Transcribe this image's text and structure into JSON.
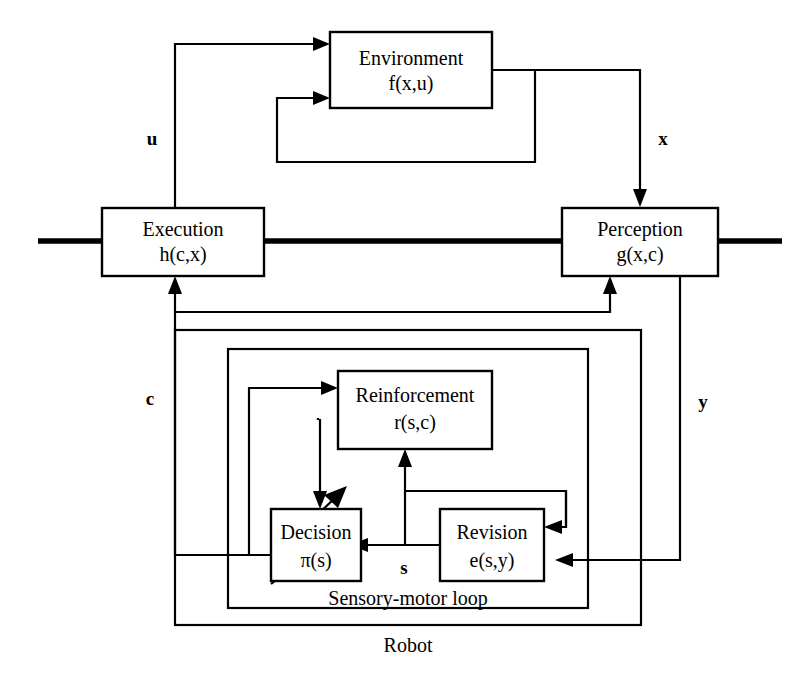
{
  "diagram": {
    "stroke_color": "#000000",
    "background_color": "#ffffff",
    "boxes": [
      {
        "id": "environment",
        "line1": "Environment",
        "line2": "f(x,u)"
      },
      {
        "id": "execution",
        "line1": "Execution",
        "line2": "h(c,x)"
      },
      {
        "id": "perception",
        "line1": "Perception",
        "line2": "g(x,c)"
      },
      {
        "id": "reinforcement",
        "line1": "Reinforcement",
        "line2": "r(s,c)"
      },
      {
        "id": "decision",
        "line1": "Decision",
        "line2": "π(s)"
      },
      {
        "id": "revision",
        "line1": "Revision",
        "line2": "e(s,y)"
      }
    ],
    "groups": [
      {
        "id": "sensory-motor-loop",
        "label": "Sensory-motor loop"
      },
      {
        "id": "robot",
        "label": "Robot"
      }
    ],
    "edge_labels": [
      {
        "id": "u",
        "text": "u"
      },
      {
        "id": "x",
        "text": "x"
      },
      {
        "id": "c",
        "text": "c"
      },
      {
        "id": "y",
        "text": "y"
      },
      {
        "id": "s",
        "text": "s"
      }
    ]
  }
}
